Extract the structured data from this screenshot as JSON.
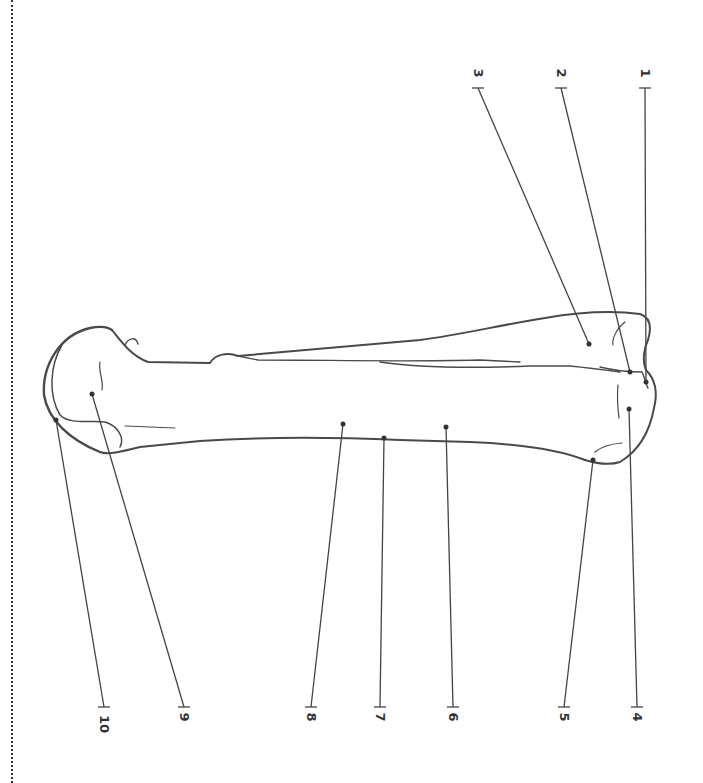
{
  "diagram": {
    "orientation": "rotated-90-clockwise",
    "labels": [
      {
        "id": "1",
        "text": "1"
      },
      {
        "id": "2",
        "text": "2"
      },
      {
        "id": "3",
        "text": "3"
      },
      {
        "id": "4",
        "text": "4"
      },
      {
        "id": "5",
        "text": "5"
      },
      {
        "id": "6",
        "text": "6"
      },
      {
        "id": "7",
        "text": "7"
      },
      {
        "id": "8",
        "text": "8"
      },
      {
        "id": "9",
        "text": "9"
      },
      {
        "id": "10",
        "text": "10"
      }
    ]
  },
  "colors": {
    "line": "#444444",
    "background": "#ffffff"
  }
}
